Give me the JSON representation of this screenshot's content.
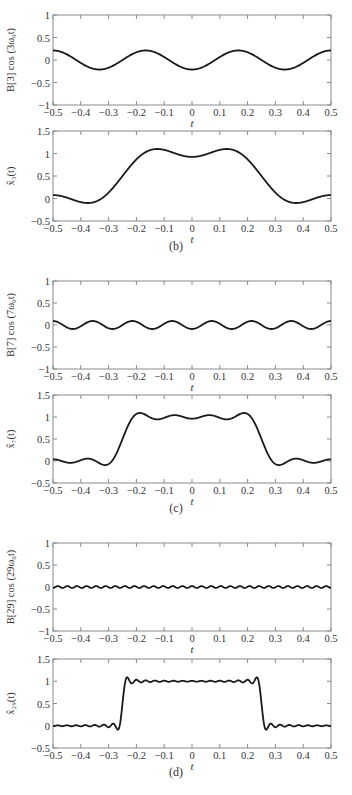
{
  "figure": {
    "panels": [
      {
        "id": "b",
        "caption": "(b)"
      },
      {
        "id": "c",
        "caption": "(c)"
      },
      {
        "id": "d",
        "caption": "(d)"
      }
    ]
  },
  "chart_data": [
    {
      "type": "line",
      "panel": "b",
      "ylabel": "B[3] cos (3ω₀t)",
      "xlabel": "t",
      "xlim": [
        -0.5,
        0.5
      ],
      "ylim": [
        -1,
        1
      ],
      "xticks": [
        "-0.5",
        "-0.4",
        "-0.3",
        "-0.2",
        "-0.1",
        "0",
        "0.1",
        "0.2",
        "0.3",
        "0.4",
        "0.5"
      ],
      "yticks": [
        "-1",
        "-0.5",
        "0",
        "0.5",
        "1"
      ],
      "series": [
        {
          "name": "B[3] cos(3ω₀t)",
          "kind": "harmonic",
          "k": 3,
          "amplitude": -0.212,
          "x": [
            -0.5,
            -0.333,
            -0.167,
            0,
            0.167,
            0.333,
            0.5
          ],
          "values": [
            0.212,
            -0.212,
            0.212,
            -0.212,
            0.212,
            -0.212,
            0.212
          ]
        }
      ],
      "grid": false
    },
    {
      "type": "line",
      "panel": "b",
      "ylabel": "x̂₃(t)",
      "xlabel": "t",
      "xlim": [
        -0.5,
        0.5
      ],
      "ylim": [
        -0.5,
        1.5
      ],
      "xticks": [
        "-0.5",
        "-0.4",
        "-0.3",
        "-0.2",
        "-0.1",
        "0",
        "0.1",
        "0.2",
        "0.3",
        "0.4",
        "0.5"
      ],
      "yticks": [
        "-0.5",
        "0",
        "0.5",
        "1",
        "1.5"
      ],
      "series": [
        {
          "name": "x̂₃(t)",
          "kind": "partial_sum",
          "J": 3,
          "pulse_halfwidth": 0.25,
          "x": [
            -0.5,
            -0.37,
            -0.25,
            -0.13,
            0,
            0.13,
            0.25,
            0.37,
            0.5
          ],
          "values": [
            0.09,
            -0.1,
            0.5,
            1.1,
            0.92,
            1.1,
            0.5,
            -0.1,
            0.09
          ]
        }
      ],
      "grid": false
    },
    {
      "type": "line",
      "panel": "c",
      "ylabel": "B[7] cos (7ω₀t)",
      "xlabel": "t",
      "xlim": [
        -0.5,
        0.5
      ],
      "ylim": [
        -1,
        1
      ],
      "xticks": [
        "-0.5",
        "-0.4",
        "-0.3",
        "-0.2",
        "-0.1",
        "0",
        "0.1",
        "0.2",
        "0.3",
        "0.4",
        "0.5"
      ],
      "yticks": [
        "-1",
        "-0.5",
        "0",
        "0.5",
        "1"
      ],
      "series": [
        {
          "name": "B[7] cos(7ω₀t)",
          "kind": "harmonic",
          "k": 7,
          "amplitude": -0.091,
          "x": [
            -0.5,
            0,
            0.5
          ],
          "values": [
            0.091,
            -0.091,
            0.091
          ]
        }
      ],
      "grid": false
    },
    {
      "type": "line",
      "panel": "c",
      "ylabel": "x̂₇(t)",
      "xlabel": "t",
      "xlim": [
        -0.5,
        0.5
      ],
      "ylim": [
        -0.5,
        1.5
      ],
      "xticks": [
        "-0.5",
        "-0.4",
        "-0.3",
        "-0.2",
        "-0.1",
        "0",
        "0.1",
        "0.2",
        "0.3",
        "0.4",
        "0.5"
      ],
      "yticks": [
        "-0.5",
        "0",
        "0.5",
        "1",
        "1.5"
      ],
      "series": [
        {
          "name": "x̂₇(t)",
          "kind": "partial_sum",
          "J": 7,
          "pulse_halfwidth": 0.25,
          "x": [
            -0.5,
            -0.31,
            -0.25,
            -0.19,
            0,
            0.19,
            0.25,
            0.31,
            0.5
          ],
          "values": [
            0.02,
            -0.12,
            0.5,
            1.1,
            0.95,
            1.1,
            0.5,
            -0.12,
            0.02
          ]
        }
      ],
      "grid": false
    },
    {
      "type": "line",
      "panel": "d",
      "ylabel": "B[29] cos (29ω₀t)",
      "xlabel": "t",
      "xlim": [
        -0.5,
        0.5
      ],
      "ylim": [
        -1,
        1
      ],
      "xticks": [
        "-0.5",
        "-0.4",
        "-0.3",
        "-0.2",
        "-0.1",
        "0",
        "0.1",
        "0.2",
        "0.3",
        "0.4",
        "0.5"
      ],
      "yticks": [
        "-1",
        "-0.5",
        "0",
        "0.5",
        "1"
      ],
      "series": [
        {
          "name": "B[29] cos(29ω₀t)",
          "kind": "harmonic",
          "k": 29,
          "amplitude": 0.022,
          "x": [
            -0.5,
            0,
            0.5
          ],
          "values": [
            -0.022,
            0.022,
            -0.022
          ]
        }
      ],
      "grid": false
    },
    {
      "type": "line",
      "panel": "d",
      "ylabel": "x̂₂₉(t)",
      "xlabel": "t",
      "xlim": [
        -0.5,
        0.5
      ],
      "ylim": [
        -0.5,
        1.5
      ],
      "xticks": [
        "-0.5",
        "-0.4",
        "-0.3",
        "-0.2",
        "-0.1",
        "0",
        "0.1",
        "0.2",
        "0.3",
        "0.4",
        "0.5"
      ],
      "yticks": [
        "-0.5",
        "0",
        "0.5",
        "1",
        "1.5"
      ],
      "series": [
        {
          "name": "x̂₂₉(t)",
          "kind": "partial_sum",
          "J": 29,
          "pulse_halfwidth": 0.25,
          "x": [
            -0.5,
            -0.26,
            -0.25,
            -0.24,
            0,
            0.24,
            0.25,
            0.26,
            0.5
          ],
          "values": [
            0,
            -0.08,
            0.5,
            1.09,
            1.0,
            1.09,
            0.5,
            -0.08,
            0
          ]
        }
      ],
      "grid": false
    }
  ]
}
